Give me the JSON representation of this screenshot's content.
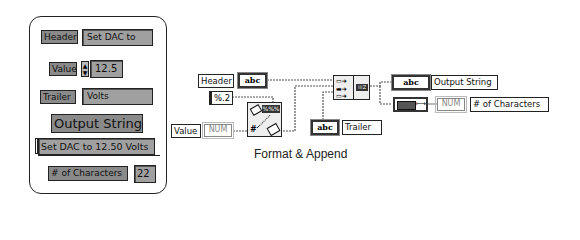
{
  "front_panel": {
    "header": {
      "label": "Header",
      "value": "Set DAC to"
    },
    "value": {
      "label": "Value",
      "value": "12.5"
    },
    "trailer": {
      "label": "Trailer",
      "value": "Volts"
    },
    "output_string": {
      "label": "Output String",
      "value": "Set DAC to 12.50 Volts"
    },
    "num_characters": {
      "label": "# of Characters",
      "value": "22"
    }
  },
  "block_diagram": {
    "header_label": "Header",
    "header_terminal": "abc",
    "format_constant": "%.2",
    "value_label": "Value",
    "value_terminal": "NUM",
    "trailer_terminal": "abc",
    "trailer_label": "Trailer",
    "output_terminal": "abc",
    "output_label": "Output String",
    "length_terminal": "NUM",
    "length_label": "# of Characters",
    "concat_out_glyph": "⁞⁞⁞Z",
    "format_icon_glyph": "%%%",
    "caption": "Format & Append"
  }
}
